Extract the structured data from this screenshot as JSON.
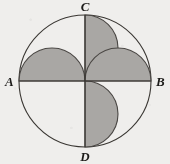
{
  "figure": {
    "background_color": "#efeeec",
    "outline_color": "#3a3733",
    "shade_color": "#a9a7a4",
    "shade_stroke_color": "#4a4744",
    "labels": {
      "left": "A",
      "right": "B",
      "top": "C",
      "bottom": "D"
    },
    "geometry": {
      "center_x": 85,
      "center_y": 81,
      "radius": 66,
      "semicircle_radius": 33,
      "diameter_horizontal": "AB",
      "diameter_vertical": "CD"
    },
    "regions": [
      {
        "name": "upper-left-semicircle",
        "chord": "A-to-center",
        "bulge": "up"
      },
      {
        "name": "upper-right-semicircle",
        "chord": "C-to-center",
        "bulge": "right"
      },
      {
        "name": "lower-right-semicircle",
        "chord": "center-to-B",
        "bulge": "down"
      },
      {
        "name": "lower-left-semicircle",
        "chord": "center-to-D",
        "bulge": "left"
      }
    ]
  }
}
